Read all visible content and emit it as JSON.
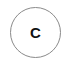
{
  "button": {
    "label": "C",
    "border_color": "#8a8a8a",
    "text_color": "#111111",
    "background": "#ffffff"
  }
}
